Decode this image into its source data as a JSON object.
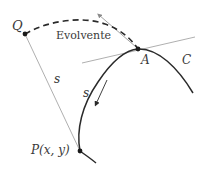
{
  "diagram": {
    "labels": {
      "point_q": "Q",
      "involute": "Evolvente",
      "point_a": "A",
      "curve_c": "C",
      "arc_length_line": "s",
      "arc_length_curve": "s",
      "point_p": "P(x, y)"
    },
    "points": {
      "Q": [
        25,
        34
      ],
      "A": [
        138,
        49
      ],
      "P": [
        80,
        151
      ]
    },
    "colors": {
      "curve": "#2a2a2a",
      "dashed": "#2a2a2a",
      "thin_line": "#9a9a9a",
      "text": "#3a3a3a"
    }
  }
}
